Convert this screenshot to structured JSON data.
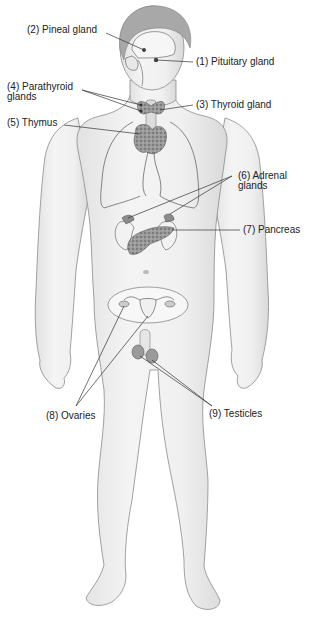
{
  "diagram": {
    "labels": [
      {
        "id": "pituitary",
        "number": "(1)",
        "name": "Pituitary gland",
        "text": "(1) Pituitary gland"
      },
      {
        "id": "pineal",
        "number": "(2)",
        "name": "Pineal gland",
        "text": "(2) Pineal gland"
      },
      {
        "id": "thyroid",
        "number": "(3)",
        "name": "Thyroid gland",
        "text": "(3) Thyroid gland"
      },
      {
        "id": "parathyroid",
        "number": "(4)",
        "name": "Parathyroid glands",
        "text": "(4) Parathyroid\nglands"
      },
      {
        "id": "thymus",
        "number": "(5)",
        "name": "Thymus",
        "text": "(5) Thymus"
      },
      {
        "id": "adrenal",
        "number": "(6)",
        "name": "Adrenal glands",
        "text": "(6) Adrenal\nglands"
      },
      {
        "id": "pancreas",
        "number": "(7)",
        "name": "Pancreas",
        "text": "(7) Pancreas"
      },
      {
        "id": "ovaries",
        "number": "(8)",
        "name": "Ovaries",
        "text": "(8) Ovaries"
      },
      {
        "id": "testicles",
        "number": "(9)",
        "name": "Testicles",
        "text": "(9) Testicles"
      }
    ],
    "colors": {
      "skin": "#ececec",
      "skin_shade": "#d6d6d6",
      "outline": "#8a8a8a",
      "hair": "#9a9a9a",
      "gland": "#8c8c8c",
      "leader_line": "#333333",
      "text": "#222222"
    }
  }
}
